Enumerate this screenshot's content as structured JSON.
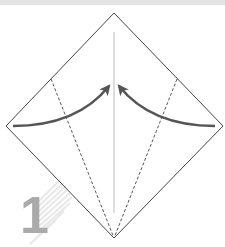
{
  "diagram": {
    "type": "origami-fold-step",
    "step_number": "1",
    "colors": {
      "background": "#ffffff",
      "top_band": "#e4e4e4",
      "paper_edge": "#444444",
      "dashed_fold": "#444444",
      "center_crease": "#bbbbbb",
      "arrow": "#555555",
      "step_number": "#aaaaaa",
      "step_shadow_stripes": "#e6e6e6"
    },
    "paper": {
      "shape": "square-diamond",
      "vertices": {
        "top": [
          114,
          13
        ],
        "right": [
          223,
          126
        ],
        "bottom": [
          114,
          238
        ],
        "left": [
          6,
          126
        ]
      }
    },
    "creases": [
      {
        "name": "center-crease",
        "style": "solid-light",
        "from": [
          114,
          32
        ],
        "to": [
          114,
          213
        ]
      },
      {
        "name": "left-valley-fold",
        "style": "dashed",
        "from": [
          51,
          79
        ],
        "to": [
          114,
          238
        ]
      },
      {
        "name": "right-valley-fold",
        "style": "dashed",
        "from": [
          177,
          79
        ],
        "to": [
          114,
          238
        ]
      }
    ],
    "arrows": [
      {
        "name": "left-fold-arrow",
        "from": [
          13,
          126
        ],
        "to": [
          111,
          83
        ]
      },
      {
        "name": "right-fold-arrow",
        "from": [
          215,
          126
        ],
        "to": [
          117,
          83
        ]
      }
    ]
  }
}
